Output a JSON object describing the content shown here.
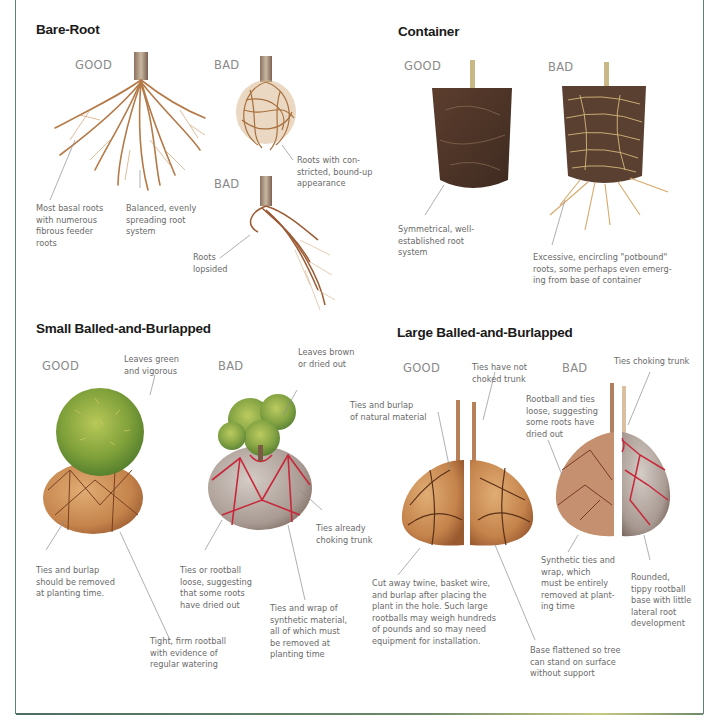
{
  "frame": {
    "border_color": "#5f8076"
  },
  "sections": {
    "bare_root": {
      "title": "Bare-Root",
      "good_label": "GOOD",
      "bad_label_1": "BAD",
      "bad_label_2": "BAD",
      "notes": {
        "basal": "Most basal roots\nwith numerous\nfibrous feeder\nroots",
        "balanced": "Balanced, evenly\nspreading root\nsystem",
        "constricted": "Roots with con-\nstricted, bound-up\nappearance",
        "lopsided": "Roots\nlopsided"
      }
    },
    "container": {
      "title": "Container",
      "good_label": "GOOD",
      "bad_label": "BAD",
      "notes": {
        "symmetrical": "Symmetrical, well-\nestablished root\nsystem",
        "potbound": "Excessive, encircling \"potbound\"\nroots, some perhaps even emerg-\ning from base of container"
      }
    },
    "small_bb": {
      "title": "Small Balled-and-Burlapped",
      "good_label": "GOOD",
      "bad_label": "BAD",
      "notes": {
        "leaves_green": "Leaves green\nand vigorous",
        "leaves_brown": "Leaves brown\nor dried out",
        "ties_remove": "Ties and burlap\nshould be removed\nat planting time.",
        "tight_rootball": "Tight, firm rootball\nwith evidence of\nregular watering",
        "ties_loose": "Ties or rootball\nloose, suggesting\nthat some roots\nhave dried out",
        "synthetic": "Ties and wrap of\nsynthetic material,\nall of which must\nbe removed at\nplanting time",
        "choking": "Ties already\nchoking trunk"
      }
    },
    "large_bb": {
      "title": "Large Balled-and-Burlapped",
      "good_label": "GOOD",
      "bad_label": "BAD",
      "notes": {
        "natural": "Ties and burlap\nof natural material",
        "not_choked": "Ties have not\nchoked trunk",
        "rootball_loose": "Rootball and ties\nloose, suggesting\nsome roots have\ndried out",
        "choking": "Ties choking trunk",
        "cut_away": "Cut away twine, basket wire,\nand burlap after placing the\nplant in the hole. Such large\nrootballs may weigh hundreds\nof pounds and so may need\nequipment for installation.",
        "synthetic": "Synthetic ties and\nwrap, which\nmust be entirely\nremoved at plant-\ning time",
        "rounded": "Rounded,\ntippy rootball\nbase with little\nlateral root\ndevelopment",
        "base_flat": "Base flattened so tree\ncan stand on surface\nwithout support"
      }
    }
  },
  "colors": {
    "root": "#b77a45",
    "root_dark": "#8a5430",
    "soil": "#4e3426",
    "burlap": "#c88950",
    "foliage": "#8fae3c",
    "synthetic_tie": "#c8283a",
    "synthetic_wrap": "#b9aea6"
  }
}
